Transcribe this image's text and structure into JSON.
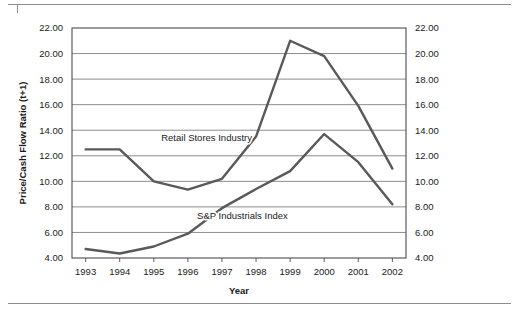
{
  "figure": {
    "has_top_rule": true,
    "has_bottom_rule": true,
    "background_color": "#ffffff",
    "frame_color": "#4d4d4d",
    "gridline_color": "#808080",
    "line_color": "#595959"
  },
  "chart_data": {
    "type": "line",
    "title": "",
    "subtitle": "",
    "xlabel": "Year",
    "ylabel": "Price/Cash Flow Ratio (t+1)",
    "ylabel_right": "Price/Cash Flow Ratio (t+1)",
    "x": [
      1993,
      1994,
      1995,
      1996,
      1997,
      1998,
      1999,
      2000,
      2001,
      2002
    ],
    "categories": [
      "1993",
      "1994",
      "1995",
      "1996",
      "1997",
      "1998",
      "1999",
      "2000",
      "2001",
      "2002"
    ],
    "xlim": [
      1992.6,
      2002.4
    ],
    "ylim": [
      4.0,
      22.0
    ],
    "yticks": [
      4.0,
      6.0,
      8.0,
      10.0,
      12.0,
      14.0,
      16.0,
      18.0,
      20.0,
      22.0
    ],
    "ytick_labels": [
      "4.00",
      "6.00",
      "8.00",
      "10.00",
      "12.00",
      "14.00",
      "16.00",
      "18.00",
      "20.00",
      "22.00"
    ],
    "ytick_labels_right": [
      "4.00",
      "6.00",
      "8.00",
      "10.00",
      "12.00",
      "14.00",
      "16.00",
      "18.00",
      "20.00",
      "22.00"
    ],
    "grid": true,
    "grid_axis": "y",
    "legend": "inline-labels",
    "legend_position": "inline",
    "series": [
      {
        "name": "Retail Stores Industry",
        "values": [
          12.5,
          12.5,
          10.0,
          9.35,
          10.2,
          13.5,
          21.0,
          19.8,
          15.9,
          11.0
        ],
        "label_x": 1996.55,
        "label_y": 13.15,
        "color": "#595959"
      },
      {
        "name": "S&P Industrials Index",
        "values": [
          4.7,
          4.35,
          4.9,
          5.9,
          7.9,
          9.4,
          10.8,
          13.7,
          11.5,
          8.2
        ],
        "label_x": 1997.6,
        "label_y": 7.05,
        "color": "#595959"
      }
    ],
    "annotations": [
      {
        "text": "Retail Stores Industry",
        "x": 1996.55,
        "y": 13.15
      },
      {
        "text": "S&P Industrials Index",
        "x": 1997.6,
        "y": 7.05
      }
    ]
  }
}
